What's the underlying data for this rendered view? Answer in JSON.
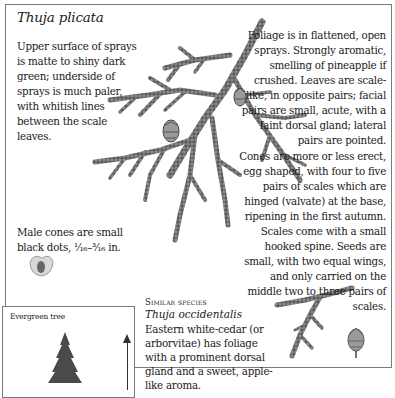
{
  "page": {
    "title": "Thuja plicata",
    "upper_surface_note": "Upper surface of sprays is matte to shiny dark green; underside of sprays is much paler, with whitish lines between the scale leaves.",
    "foliage_note": "Foliage is in flattened, open sprays. Strongly aromatic, smelling of pineapple if crushed. Leaves are scale-like, in opposite pairs; facial pairs are small, acute, with a faint dorsal gland; lateral pairs are pointed.",
    "cones_note": "Cones are more or less erect, egg shaped, with four to five pairs of scales which are hinged (valvate) at the base, ripening in the first autumn. Scales come with a small hooked spine. Seeds are small, with two equal wings, and only carried on the middle two to three pairs of scales.",
    "male_cones_note": "Male cones are small black dots, ¹⁄₁₆–³⁄₁₆ in."
  },
  "tree_box": {
    "label": "Evergreen tree"
  },
  "similar_species": {
    "heading": "Similar species",
    "name": "Thuja occidentalis",
    "description": "Eastern white-cedar (or arborvitae) has foliage with a prominent dorsal gland and a sweet, apple-like aroma."
  },
  "illustrations": {
    "main": "thuja-plicata-branch-with-cones",
    "male_cone": "male-cone",
    "similar_branch": "thuja-occidentalis-branch",
    "similar_cone": "thuja-occidentalis-cone",
    "tree": "evergreen-tree-silhouette"
  },
  "colors": {
    "text": "#1a1a1a",
    "frame": "#7a7a7a",
    "foliage": "#555555",
    "background": "#ffffff"
  }
}
